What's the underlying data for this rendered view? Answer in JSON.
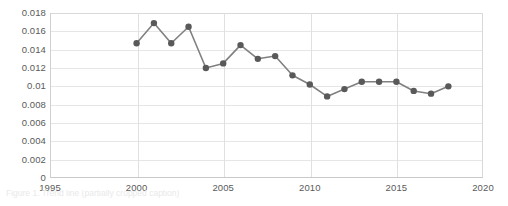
{
  "chart_data": {
    "type": "line",
    "title": "",
    "subtitle": "",
    "xlabel": "",
    "ylabel": "",
    "x": [
      2000,
      2001,
      2002,
      2003,
      2004,
      2005,
      2006,
      2007,
      2008,
      2009,
      2010,
      2011,
      2012,
      2013,
      2014,
      2015,
      2016,
      2017,
      2018
    ],
    "values": [
      0.0147,
      0.0169,
      0.0147,
      0.0165,
      0.012,
      0.0125,
      0.0145,
      0.013,
      0.0133,
      0.0112,
      0.0102,
      0.0089,
      0.0097,
      0.0105,
      0.0105,
      0.0105,
      0.0095,
      0.0092,
      0.01
    ],
    "series": [
      {
        "name": "series-1",
        "values": [
          0.0147,
          0.0169,
          0.0147,
          0.0165,
          0.012,
          0.0125,
          0.0145,
          0.013,
          0.0133,
          0.0112,
          0.0102,
          0.0089,
          0.0097,
          0.0105,
          0.0105,
          0.0105,
          0.0095,
          0.0092,
          0.01
        ]
      }
    ],
    "xlim": [
      1995,
      2020
    ],
    "ylim": [
      0,
      0.018
    ],
    "ytick_labels": [
      "0.018",
      "0.016",
      "0.014",
      "0.012",
      "0.01",
      "0.008",
      "0.006",
      "0.004",
      "0.002",
      "0"
    ],
    "ytick_values": [
      0.018,
      0.016,
      0.014,
      0.012,
      0.01,
      0.008,
      0.006,
      0.004,
      0.002,
      0
    ],
    "xtick_labels": [
      "1995",
      "2000",
      "2005",
      "2010",
      "2015",
      "2020"
    ],
    "xtick_values": [
      1995,
      2000,
      2005,
      2010,
      2015,
      2020
    ],
    "grid": "horizontal-and-vertical",
    "legend": "none",
    "line_color": "#808080",
    "marker_color": "#595959",
    "marker_shape": "circle",
    "gridline_color": "#e6e6e6",
    "axis_label_color": "#5a5a5a",
    "background_color": "#ffffff"
  },
  "caption": {
    "text": "Figure 1. Trend line (partially cropped caption)"
  }
}
